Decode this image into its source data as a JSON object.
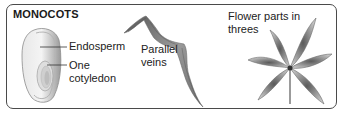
{
  "diagram": {
    "title": "MONOCOTS",
    "panels": [
      {
        "id": "seed",
        "labels": [
          {
            "id": "endosperm",
            "text": "Endosperm"
          },
          {
            "id": "cotyledon",
            "text": "One cotyledon"
          }
        ]
      },
      {
        "id": "leaf",
        "labels": [
          {
            "id": "veins",
            "text": "Parallel veins"
          }
        ]
      },
      {
        "id": "flower",
        "labels": [
          {
            "id": "flower-parts",
            "text": "Flower parts in threes"
          }
        ]
      }
    ],
    "colors": {
      "border": "#4a4a4a",
      "text": "#222222",
      "illustration_gray": "#8a8a8a"
    }
  }
}
